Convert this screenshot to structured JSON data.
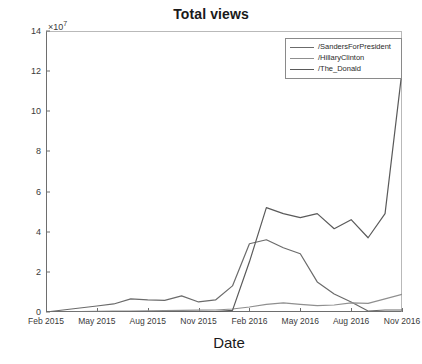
{
  "chart_data": {
    "type": "line",
    "title": "Total views",
    "xlabel": "Date",
    "ylabel": "Total views",
    "y_multiplier": "×10",
    "y_multiplier_exponent": "7",
    "grid": false,
    "legend_position": "top-right",
    "xlim": [
      "Feb 2015",
      "Nov 2016"
    ],
    "ylim": [
      0,
      140000000
    ],
    "ytick_labels": [
      "0",
      "2",
      "4",
      "6",
      "8",
      "10",
      "12",
      "14"
    ],
    "ytick_values": [
      0,
      20000000,
      40000000,
      60000000,
      80000000,
      100000000,
      120000000,
      140000000
    ],
    "xtick_labels": [
      "Feb 2015",
      "May 2015",
      "Aug 2015",
      "Nov 2015",
      "Feb 2016",
      "May 2016",
      "Aug 2016",
      "Nov 2016"
    ],
    "x": [
      "Feb 2015",
      "Mar 2015",
      "Apr 2015",
      "May 2015",
      "Jun 2015",
      "Jul 2015",
      "Aug 2015",
      "Sep 2015",
      "Oct 2015",
      "Nov 2015",
      "Dec 2015",
      "Jan 2016",
      "Feb 2016",
      "Mar 2016",
      "Apr 2016",
      "May 2016",
      "Jun 2016",
      "Jul 2016",
      "Aug 2016",
      "Sep 2016",
      "Oct 2016",
      "Nov 2016"
    ],
    "series": [
      {
        "name": "/SandersForPresident",
        "color": "#6b6b6b",
        "values": [
          0,
          1000000,
          2000000,
          3000000,
          4000000,
          6500000,
          6000000,
          5800000,
          8000000,
          5000000,
          6000000,
          13000000,
          34000000,
          36000000,
          32000000,
          29000000,
          15000000,
          9000000,
          5000000,
          500000,
          1000000,
          1000000
        ]
      },
      {
        "name": "/HillaryClinton",
        "color": "#8f8f8f",
        "values": [
          0,
          100000,
          200000,
          300000,
          400000,
          500000,
          600000,
          700000,
          800000,
          900000,
          1000000,
          1500000,
          2500000,
          3800000,
          4500000,
          3800000,
          3200000,
          3500000,
          4500000,
          4300000,
          6500000,
          8800000
        ]
      },
      {
        "name": "/The_Donald",
        "color": "#5a5a5a",
        "values": [
          0,
          0,
          0,
          0,
          0,
          0,
          0,
          0,
          0,
          0,
          200000,
          800000,
          25000000,
          52000000,
          49000000,
          47000000,
          49000000,
          41500000,
          46000000,
          37000000,
          49000000,
          120000000
        ]
      }
    ]
  }
}
